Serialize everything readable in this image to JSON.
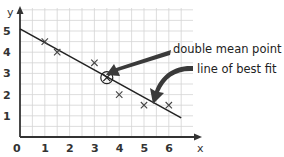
{
  "chart_data": {
    "type": "scatter",
    "title": "",
    "xlabel": "x",
    "ylabel": "y",
    "xlim": [
      0,
      7
    ],
    "ylim": [
      0,
      6
    ],
    "grid": true,
    "grid_step": 0.5,
    "x_ticks": [
      "0",
      "1",
      "2",
      "3",
      "4",
      "5",
      "6"
    ],
    "y_ticks": [
      "1",
      "2",
      "3",
      "4",
      "5"
    ],
    "points": [
      {
        "x": 1,
        "y": 4.5
      },
      {
        "x": 1.5,
        "y": 4
      },
      {
        "x": 3,
        "y": 3.5
      },
      {
        "x": 4,
        "y": 2
      },
      {
        "x": 5,
        "y": 1.5
      },
      {
        "x": 6,
        "y": 1.5
      }
    ],
    "double_mean_point": {
      "x": 3.5,
      "y": 2.8
    },
    "line_of_best_fit": {
      "x1": 0,
      "y1": 5.1,
      "x2": 6.5,
      "y2": 0.9
    },
    "annotations": [
      {
        "label": "double mean point",
        "target": "double_mean_point"
      },
      {
        "label": "line of best fit",
        "target": "line_of_best_fit"
      }
    ],
    "colors": {
      "grid": "#d4d4d4",
      "axis": "#333333",
      "line": "#222222",
      "marker": "#444444",
      "arrow": "#3a3a3a"
    }
  }
}
